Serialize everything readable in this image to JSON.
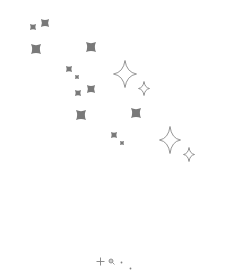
{
  "canvas": {
    "background": "#ffffff",
    "width": 237,
    "height": 258,
    "label": "sparkle pattern"
  },
  "colors": {
    "filled_sparkle": "#6a6a6a",
    "outline_star": "#7a7a7a",
    "toolbar_icon": "#808080"
  },
  "filled_sparkles": [
    {
      "x": 33,
      "y": 27,
      "size": 3
    },
    {
      "x": 45,
      "y": 23,
      "size": 4
    },
    {
      "x": 36,
      "y": 49,
      "size": 5
    },
    {
      "x": 91,
      "y": 47,
      "size": 5
    },
    {
      "x": 69,
      "y": 69,
      "size": 3
    },
    {
      "x": 77,
      "y": 77,
      "size": 2
    },
    {
      "x": 78,
      "y": 93,
      "size": 3
    },
    {
      "x": 91,
      "y": 89,
      "size": 4
    },
    {
      "x": 81,
      "y": 115,
      "size": 5
    },
    {
      "x": 136,
      "y": 113,
      "size": 5
    },
    {
      "x": 114,
      "y": 135,
      "size": 3
    },
    {
      "x": 122,
      "y": 143,
      "size": 2
    }
  ],
  "outline_stars": [
    {
      "x": 125,
      "y": 74,
      "w": 24,
      "h": 28
    },
    {
      "x": 144,
      "y": 88,
      "w": 12,
      "h": 15
    },
    {
      "x": 170,
      "y": 140,
      "w": 22,
      "h": 28
    },
    {
      "x": 189,
      "y": 154,
      "w": 12,
      "h": 15
    }
  ],
  "bottom_bar": {
    "tools": [
      {
        "name": "plus-icon",
        "x": 100,
        "y": 255
      },
      {
        "name": "zoom-icon",
        "x": 111,
        "y": 253
      },
      {
        "name": "dot-icon",
        "x": 121,
        "y": 250
      },
      {
        "name": "dot-icon",
        "x": 130,
        "y": 256
      }
    ]
  }
}
